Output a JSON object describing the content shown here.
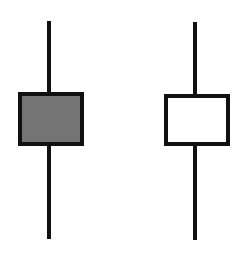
{
  "diagram": {
    "title": "",
    "candles": [
      {
        "type": "bearish",
        "name": "filled-candlestick",
        "body_fill": "#747474",
        "border_color": "#111111",
        "wick": {
          "x": 49,
          "top": 21,
          "bottom": 239
        },
        "body": {
          "left": 18,
          "top": 92,
          "width": 66,
          "height": 54
        }
      },
      {
        "type": "bullish",
        "name": "hollow-candlestick",
        "body_fill": "#ffffff",
        "border_color": "#111111",
        "wick": {
          "x": 195,
          "top": 22,
          "bottom": 240
        },
        "body": {
          "left": 164,
          "top": 94,
          "width": 66,
          "height": 52
        }
      }
    ]
  }
}
